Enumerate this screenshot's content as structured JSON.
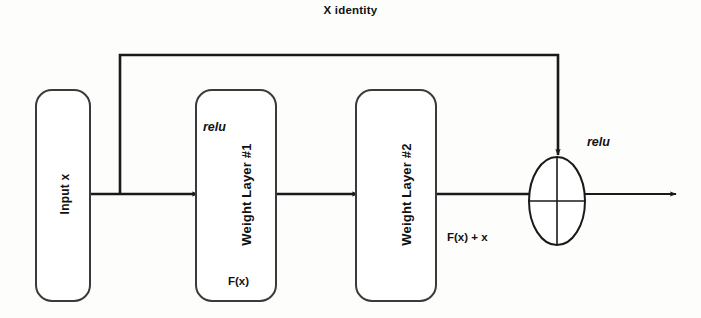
{
  "diagram": {
    "title": "X identity",
    "type": "residual-block",
    "background_color": "#fdfdfc",
    "stroke_color": "#1a1a1a",
    "blocks": [
      {
        "id": "input",
        "label": "Input x",
        "shape": "rounded-rect",
        "rotated": true
      },
      {
        "id": "weight_layer_1",
        "label": "Weight Layer #1",
        "shape": "rounded-rect",
        "rotated": true
      },
      {
        "id": "weight_layer_2",
        "label": "Weight  Layer #2",
        "shape": "rounded-rect",
        "rotated": true
      },
      {
        "id": "sum_node",
        "label": "",
        "shape": "ellipse-plus",
        "rotated": false
      }
    ],
    "annotations": {
      "relu_after_layer1": "relu",
      "relu_after_sum": "relu",
      "residual_function": "F(x)",
      "sum_output": "F(x) + x",
      "skip_connection": "X identity"
    }
  }
}
